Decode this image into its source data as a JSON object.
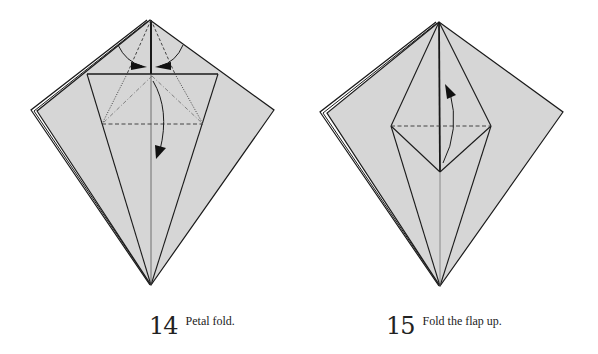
{
  "steps": [
    {
      "number": "14",
      "caption": "Petal fold."
    },
    {
      "number": "15",
      "caption": "Fold the flap up."
    }
  ],
  "colors": {
    "paper_fill": "#d6d6d6",
    "line": "#1a1a1a",
    "background": "#ffffff"
  }
}
